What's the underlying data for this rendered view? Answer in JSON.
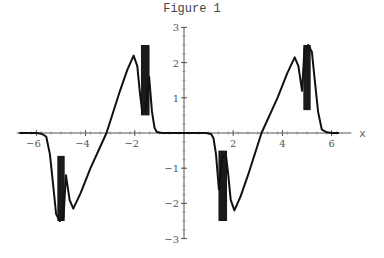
{
  "title": "Figure 1",
  "chart_data": {
    "type": "line",
    "title": "Figure 1",
    "xlabel": "x",
    "ylabel": "",
    "xlim": [
      -6.8,
      6.8
    ],
    "ylim": [
      -3,
      3
    ],
    "x_ticks": [
      -6,
      -4,
      -2,
      2,
      4,
      6
    ],
    "y_ticks": [
      -3,
      -2,
      -1,
      1,
      2,
      3
    ],
    "grid": false,
    "legend": null,
    "series": [
      {
        "name": "f(x)",
        "x": [
          -6.7,
          -6.0,
          -5.8,
          -5.6,
          -5.45,
          -5.3,
          -5.2,
          -5.05,
          -4.9,
          -4.8,
          -4.65,
          -4.5,
          -4.2,
          -3.8,
          -3.15,
          -2.6,
          -2.3,
          -2.05,
          -1.9,
          -1.8,
          -1.7,
          -1.55,
          -1.42,
          -1.3,
          -1.2,
          -1.1,
          -0.9,
          0.0,
          0.9,
          1.1,
          1.2,
          1.3,
          1.42,
          1.55,
          1.7,
          1.8,
          1.9,
          2.05,
          2.3,
          2.6,
          3.15,
          3.8,
          4.2,
          4.5,
          4.65,
          4.8,
          4.9,
          5.05,
          5.2,
          5.3,
          5.45,
          5.6,
          5.8,
          6.0,
          6.3
        ],
        "y": [
          0.0,
          0.0,
          -0.02,
          -0.1,
          -0.6,
          -1.6,
          -2.3,
          -2.5,
          -2.4,
          -1.2,
          -1.9,
          -2.15,
          -1.7,
          -1.0,
          0.0,
          1.2,
          1.8,
          2.2,
          1.9,
          1.2,
          0.6,
          0.7,
          1.6,
          0.6,
          0.15,
          0.03,
          0.0,
          0.0,
          0.0,
          -0.03,
          -0.15,
          -0.6,
          -1.6,
          -0.7,
          -0.6,
          -1.2,
          -1.9,
          -2.2,
          -1.8,
          -1.2,
          0.0,
          1.0,
          1.7,
          2.15,
          1.9,
          1.2,
          2.4,
          2.5,
          2.3,
          1.6,
          0.6,
          0.1,
          0.02,
          0.0,
          0.0
        ]
      }
    ],
    "oscillation_bands": [
      {
        "x_range": [
          -5.15,
          -4.85
        ],
        "y_range": [
          -2.5,
          -0.65
        ]
      },
      {
        "x_range": [
          -1.75,
          -1.4
        ],
        "y_range": [
          0.5,
          2.5
        ]
      },
      {
        "x_range": [
          1.4,
          1.75
        ],
        "y_range": [
          -2.5,
          -0.5
        ]
      },
      {
        "x_range": [
          4.85,
          5.15
        ],
        "y_range": [
          0.65,
          2.5
        ]
      }
    ]
  }
}
